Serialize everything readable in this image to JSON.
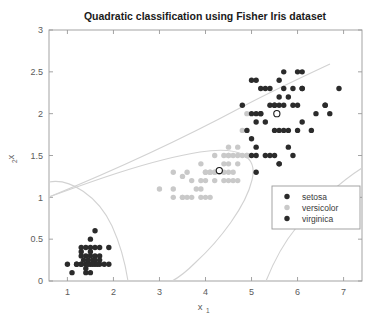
{
  "chart_data": {
    "type": "scatter",
    "title": "Quadratic classification using Fisher Iris dataset",
    "xlabel": "x",
    "xlabel_sub": "1",
    "ylabel": "x",
    "ylabel_sub": "2",
    "xlim": [
      0.6,
      7.4
    ],
    "ylim": [
      0,
      3
    ],
    "xticks": [
      1,
      2,
      3,
      4,
      5,
      6,
      7
    ],
    "xticklabels": [
      "1",
      "2",
      "3",
      "4",
      "5",
      "6",
      "7"
    ],
    "yticks": [
      0,
      0.5,
      1,
      1.5,
      2,
      2.5,
      3
    ],
    "yticklabels": [
      "0",
      "0.5",
      "1",
      "1.5",
      "2",
      "2.5",
      "3"
    ],
    "grid": false,
    "legend_position": "center-right",
    "series": [
      {
        "name": "setosa",
        "color": "#2b2b2b",
        "marker": "circle",
        "points": [
          [
            1.0,
            0.2
          ],
          [
            1.1,
            0.1
          ],
          [
            1.2,
            0.2
          ],
          [
            1.3,
            0.2
          ],
          [
            1.4,
            0.2
          ],
          [
            1.5,
            0.2
          ],
          [
            1.6,
            0.2
          ],
          [
            1.7,
            0.2
          ],
          [
            1.9,
            0.2
          ],
          [
            1.4,
            0.1
          ],
          [
            1.5,
            0.1
          ],
          [
            1.3,
            0.3
          ],
          [
            1.4,
            0.3
          ],
          [
            1.5,
            0.3
          ],
          [
            1.6,
            0.3
          ],
          [
            1.7,
            0.3
          ],
          [
            1.3,
            0.4
          ],
          [
            1.4,
            0.4
          ],
          [
            1.5,
            0.4
          ],
          [
            1.6,
            0.4
          ],
          [
            1.7,
            0.4
          ],
          [
            1.9,
            0.4
          ],
          [
            1.5,
            0.5
          ],
          [
            1.6,
            0.6
          ],
          [
            1.3,
            0.2
          ],
          [
            1.45,
            0.25
          ],
          [
            1.55,
            0.25
          ],
          [
            1.35,
            0.25
          ],
          [
            1.6,
            0.25
          ],
          [
            1.4,
            0.15
          ],
          [
            1.2,
            0.2
          ],
          [
            1.5,
            0.35
          ],
          [
            1.3,
            0.35
          ],
          [
            1.7,
            0.25
          ],
          [
            1.8,
            0.2
          ],
          [
            1.45,
            0.2
          ],
          [
            1.55,
            0.2
          ],
          [
            1.65,
            0.2
          ]
        ]
      },
      {
        "name": "versicolor",
        "color": "#c9c9c9",
        "marker": "circle",
        "points": [
          [
            3.0,
            1.1
          ],
          [
            3.3,
            1.0
          ],
          [
            3.5,
            1.0
          ],
          [
            3.7,
            1.0
          ],
          [
            3.9,
            1.0
          ],
          [
            3.3,
            1.3
          ],
          [
            3.5,
            1.25
          ],
          [
            3.9,
            1.4
          ],
          [
            4.0,
            1.3
          ],
          [
            4.1,
            1.3
          ],
          [
            4.2,
            1.3
          ],
          [
            4.3,
            1.3
          ],
          [
            4.4,
            1.3
          ],
          [
            4.5,
            1.3
          ],
          [
            4.6,
            1.3
          ],
          [
            4.7,
            1.4
          ],
          [
            4.5,
            1.5
          ],
          [
            4.6,
            1.5
          ],
          [
            4.7,
            1.5
          ],
          [
            4.8,
            1.5
          ],
          [
            4.9,
            1.5
          ],
          [
            4.4,
            1.4
          ],
          [
            4.5,
            1.4
          ],
          [
            4.1,
            1.0
          ],
          [
            4.2,
            1.2
          ],
          [
            4.4,
            1.2
          ],
          [
            4.5,
            1.2
          ],
          [
            4.6,
            1.2
          ],
          [
            4.7,
            1.2
          ],
          [
            4.9,
            1.5
          ],
          [
            3.6,
            1.3
          ],
          [
            3.8,
            1.1
          ],
          [
            3.9,
            1.2
          ],
          [
            4.0,
            1.0
          ],
          [
            4.2,
            1.5
          ],
          [
            4.4,
            1.5
          ],
          [
            4.7,
            1.6
          ],
          [
            4.5,
            1.6
          ],
          [
            4.0,
            1.3
          ],
          [
            4.1,
            1.3
          ],
          [
            3.5,
            1.0
          ],
          [
            3.9,
            1.1
          ],
          [
            4.2,
            1.3
          ],
          [
            4.5,
            1.5
          ],
          [
            4.8,
            1.8
          ],
          [
            4.9,
            2.0
          ],
          [
            4.0,
            1.2
          ],
          [
            3.3,
            1.1
          ],
          [
            3.6,
            1.0
          ],
          [
            3.7,
            1.2
          ]
        ]
      },
      {
        "name": "virginica",
        "color": "#2b2b2b",
        "marker": "circle",
        "points": [
          [
            5.0,
            1.7
          ],
          [
            5.1,
            1.9
          ],
          [
            5.1,
            2.0
          ],
          [
            5.2,
            2.0
          ],
          [
            5.3,
            1.9
          ],
          [
            5.4,
            2.1
          ],
          [
            5.5,
            2.1
          ],
          [
            5.6,
            2.1
          ],
          [
            5.6,
            2.4
          ],
          [
            5.7,
            2.3
          ],
          [
            5.8,
            2.2
          ],
          [
            5.9,
            2.1
          ],
          [
            6.0,
            2.5
          ],
          [
            6.1,
            2.3
          ],
          [
            6.1,
            1.9
          ],
          [
            6.3,
            1.8
          ],
          [
            6.6,
            2.1
          ],
          [
            6.7,
            2.0
          ],
          [
            6.9,
            2.3
          ],
          [
            5.0,
            1.5
          ],
          [
            5.1,
            1.5
          ],
          [
            5.1,
            1.6
          ],
          [
            5.2,
            2.3
          ],
          [
            5.3,
            2.3
          ],
          [
            5.5,
            1.8
          ],
          [
            5.6,
            1.8
          ],
          [
            5.6,
            1.4
          ],
          [
            5.7,
            2.1
          ],
          [
            5.8,
            1.6
          ],
          [
            5.9,
            2.3
          ],
          [
            6.0,
            1.8
          ],
          [
            6.1,
            2.5
          ],
          [
            6.4,
            2.0
          ],
          [
            6.6,
            2.1
          ],
          [
            4.9,
            1.8
          ],
          [
            5.0,
            2.0
          ],
          [
            5.1,
            2.4
          ],
          [
            5.2,
            2.0
          ],
          [
            5.4,
            2.3
          ],
          [
            5.5,
            2.1
          ],
          [
            5.6,
            2.2
          ],
          [
            5.7,
            2.5
          ],
          [
            5.8,
            1.8
          ],
          [
            6.0,
            2.1
          ],
          [
            6.1,
            2.3
          ],
          [
            5.3,
            1.5
          ],
          [
            5.4,
            1.5
          ],
          [
            5.6,
            1.4
          ],
          [
            5.7,
            1.8
          ],
          [
            5.9,
            1.5
          ],
          [
            5.1,
            1.3
          ],
          [
            5.5,
            1.5
          ],
          [
            5.0,
            2.4
          ],
          [
            4.8,
            2.1
          ]
        ]
      }
    ],
    "centroids": [
      {
        "label": "versicolor-centroid",
        "x": 4.3,
        "y": 1.32
      },
      {
        "label": "virginica-centroid",
        "x": 5.55,
        "y": 2.0
      }
    ],
    "legend": [
      {
        "label": "setosa",
        "color": "#2b2b2b"
      },
      {
        "label": "versicolor",
        "color": "#c9c9c9"
      },
      {
        "label": "virginica",
        "color": "#2b2b2b"
      }
    ],
    "boundary_color": "#d2d2d2"
  }
}
